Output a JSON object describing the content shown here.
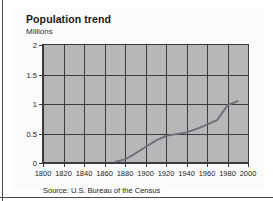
{
  "figure": {
    "title": "Population trend",
    "subtitle": "Millions",
    "source": "Source: U.S. Bureau of the Census"
  },
  "colors": {
    "plot_background": "#b7b7b7",
    "gridline": "#3a3a40",
    "series_line": "#6e6e78",
    "frame": "#4a4a52",
    "card_background": "#fbfbfb",
    "text": "#1a1a1a"
  },
  "chart_data": {
    "type": "line",
    "title": "Population trend",
    "subtitle": "Millions",
    "xlabel": "",
    "ylabel": "Millions",
    "xlim": [
      1800,
      2000
    ],
    "ylim": [
      0,
      2
    ],
    "xticks": [
      1800,
      1820,
      1840,
      1860,
      1880,
      1900,
      1920,
      1940,
      1960,
      1980,
      2000
    ],
    "xtick_labels": [
      "1800",
      "1820",
      "1840",
      "1860",
      "1880",
      "1900",
      "1920",
      "1940",
      "1960",
      "1980",
      "2000"
    ],
    "yticks": [
      0,
      0.5,
      1,
      1.5,
      2
    ],
    "ytick_labels": [
      "0",
      "0.5",
      "1",
      "1.5",
      "2"
    ],
    "grid": true,
    "legend": "none",
    "series": [
      {
        "name": "Population",
        "units": "Millions",
        "x": [
          1870,
          1880,
          1890,
          1900,
          1910,
          1920,
          1930,
          1940,
          1950,
          1960,
          1970,
          1980,
          1990
        ],
        "y": [
          0.02,
          0.06,
          0.16,
          0.27,
          0.38,
          0.46,
          0.49,
          0.52,
          0.58,
          0.65,
          0.73,
          0.98,
          1.05
        ]
      }
    ],
    "annotations": [
      "Source: U.S. Bureau of the Census"
    ]
  }
}
